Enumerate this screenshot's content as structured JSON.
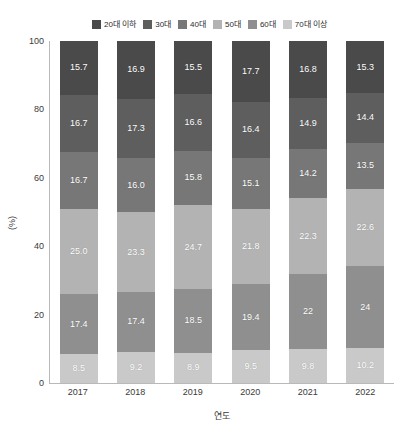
{
  "chart_data": {
    "type": "bar",
    "subtype": "stacked-bar-100",
    "title": "",
    "xlabel": "연도",
    "ylabel": "(%)",
    "ylim": [
      0,
      100
    ],
    "yticks": [
      0,
      20,
      40,
      60,
      80,
      100
    ],
    "grid": false,
    "legend_position": "top-center",
    "categories": [
      "2017",
      "2018",
      "2019",
      "2020",
      "2021",
      "2022"
    ],
    "series": [
      {
        "name": "20대 이하",
        "color": "#4a4a4a",
        "values": [
          15.7,
          16.9,
          15.5,
          17.7,
          16.8,
          15.3
        ],
        "labels": [
          "15.7",
          "16.9",
          "15.5",
          "17.7",
          "16.8",
          "15.3"
        ]
      },
      {
        "name": "30대",
        "color": "#5e5e5e",
        "values": [
          16.7,
          17.3,
          16.6,
          16.4,
          14.9,
          14.4
        ],
        "labels": [
          "16.7",
          "17.3",
          "16.6",
          "16.4",
          "14.9",
          "14.4"
        ]
      },
      {
        "name": "40대",
        "color": "#777777",
        "values": [
          16.7,
          16.0,
          15.8,
          15.1,
          14.2,
          13.5
        ],
        "labels": [
          "16.7",
          "16.0",
          "15.8",
          "15.1",
          "14.2",
          "13.5"
        ]
      },
      {
        "name": "50대",
        "color": "#b3b3b3",
        "values": [
          25.0,
          23.3,
          24.7,
          21.8,
          22.3,
          22.6
        ],
        "labels": [
          "25.0",
          "23.3",
          "24.7",
          "21.8",
          "22.3",
          "22.6"
        ]
      },
      {
        "name": "60대",
        "color": "#8f8f8f",
        "values": [
          17.4,
          17.4,
          18.5,
          19.4,
          22.0,
          24.0
        ],
        "labels": [
          "17.4",
          "17.4",
          "18.5",
          "19.4",
          "22",
          "24"
        ]
      },
      {
        "name": "70대 이상",
        "color": "#c9c9c9",
        "values": [
          8.5,
          9.2,
          8.9,
          9.5,
          9.8,
          10.2
        ],
        "labels": [
          "8.5",
          "9.2",
          "8.9",
          "9.5",
          "9.8",
          "10.2"
        ]
      }
    ]
  }
}
